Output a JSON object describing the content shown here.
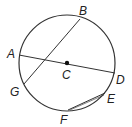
{
  "diagram": {
    "type": "circle-geometry",
    "circle": {
      "cx": 67,
      "cy": 63,
      "r": 48,
      "stroke": "#333333"
    },
    "center_point": {
      "label": "C",
      "x": 67,
      "y": 63
    },
    "points": {
      "A": {
        "x": 19,
        "y": 55
      },
      "B": {
        "x": 80,
        "y": 19
      },
      "D": {
        "x": 115,
        "y": 73
      },
      "E": {
        "x": 105,
        "y": 93
      },
      "F": {
        "x": 68,
        "y": 110
      },
      "G": {
        "x": 24,
        "y": 84
      }
    },
    "segments": [
      {
        "name": "diameter-AD",
        "from": "A",
        "to": "D"
      },
      {
        "name": "chord-BG",
        "from": "B",
        "to": "G"
      },
      {
        "name": "chord-EF",
        "from": "E",
        "to": "F"
      }
    ],
    "labels": {
      "A": "A",
      "B": "B",
      "C": "C",
      "D": "D",
      "E": "E",
      "F": "F",
      "G": "G"
    }
  }
}
